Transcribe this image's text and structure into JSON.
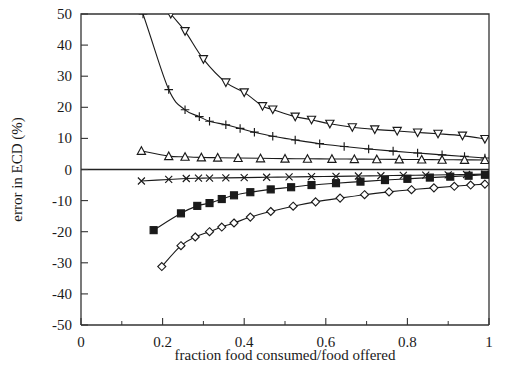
{
  "figure": {
    "background_color": "#ffffff",
    "foreground_color": "#1a1a1a"
  },
  "chart_data": {
    "type": "line",
    "title": "",
    "xlabel": "fraction food consumed/food offered",
    "ylabel": "error in ECD (%)",
    "xlim": [
      0,
      1
    ],
    "ylim": [
      -50,
      50
    ],
    "xticks": [
      0,
      0.2,
      0.4,
      0.6,
      0.8,
      1
    ],
    "xtick_labels": [
      "0",
      "0.2",
      "0.4",
      "0.6",
      "0.8",
      "1"
    ],
    "xticks_minor": [
      0.1,
      0.3,
      0.5,
      0.7,
      0.9
    ],
    "yticks": [
      50,
      40,
      30,
      20,
      10,
      0,
      -10,
      -20,
      -30,
      -40,
      -50
    ],
    "ytick_labels": [
      "50",
      "40",
      "30",
      "20",
      "10",
      "0",
      "-10",
      "-20",
      "-30",
      "-40",
      "-50"
    ],
    "grid": false,
    "legend": "none",
    "zero_reference_line": 0,
    "series": [
      {
        "name": "series-triangle-down",
        "marker": "triangle-down",
        "marker_style": "open",
        "marker_size": 7,
        "x": [
          0.22,
          0.255,
          0.3,
          0.355,
          0.4,
          0.445,
          0.47,
          0.525,
          0.565,
          0.61,
          0.665,
          0.72,
          0.775,
          0.825,
          0.875,
          0.935,
          0.99
        ],
        "y": [
          50.0,
          44.5,
          35.5,
          28.0,
          24.8,
          20.4,
          19.3,
          17.0,
          16.0,
          14.7,
          13.6,
          12.9,
          12.4,
          11.9,
          11.5,
          10.9,
          9.8
        ]
      },
      {
        "name": "series-plus",
        "marker": "plus",
        "marker_style": "open",
        "marker_size": 7,
        "x": [
          0.152,
          0.215,
          0.255,
          0.29,
          0.315,
          0.355,
          0.39,
          0.425,
          0.47,
          0.525,
          0.585,
          0.645,
          0.705,
          0.765,
          0.825,
          0.885,
          0.94,
          0.99
        ],
        "y": [
          50.0,
          25.7,
          19.2,
          17.0,
          15.5,
          14.4,
          13.2,
          12.0,
          10.7,
          9.5,
          8.3,
          7.4,
          6.6,
          5.9,
          5.3,
          4.7,
          4.2,
          3.7
        ]
      },
      {
        "name": "series-triangle-up",
        "marker": "triangle-up",
        "marker_style": "open",
        "marker_size": 7,
        "x": [
          0.148,
          0.215,
          0.255,
          0.295,
          0.335,
          0.385,
          0.44,
          0.5,
          0.555,
          0.615,
          0.67,
          0.725,
          0.78,
          0.835,
          0.885,
          0.94,
          0.99
        ],
        "y": [
          6.0,
          4.3,
          4.1,
          3.9,
          3.8,
          3.7,
          3.6,
          3.5,
          3.45,
          3.4,
          3.35,
          3.3,
          3.25,
          3.2,
          3.15,
          3.1,
          3.05
        ]
      },
      {
        "name": "series-cross",
        "marker": "cross",
        "marker_style": "open",
        "marker_size": 7,
        "x": [
          0.148,
          0.215,
          0.258,
          0.288,
          0.315,
          0.355,
          0.4,
          0.455,
          0.51,
          0.565,
          0.625,
          0.68,
          0.735,
          0.79,
          0.845,
          0.9,
          0.945,
          0.99
        ],
        "y": [
          -3.7,
          -3.2,
          -2.9,
          -2.8,
          -2.75,
          -2.7,
          -2.6,
          -2.5,
          -2.4,
          -2.3,
          -2.2,
          -2.1,
          -2.0,
          -1.9,
          -1.8,
          -1.7,
          -1.6,
          -1.5
        ]
      },
      {
        "name": "series-square-filled",
        "marker": "square",
        "marker_style": "filled",
        "marker_size": 7,
        "x": [
          0.178,
          0.245,
          0.285,
          0.315,
          0.345,
          0.375,
          0.415,
          0.465,
          0.515,
          0.565,
          0.625,
          0.685,
          0.745,
          0.8,
          0.855,
          0.905,
          0.95,
          0.99
        ],
        "y": [
          -19.5,
          -14.1,
          -11.7,
          -10.8,
          -9.5,
          -8.3,
          -7.3,
          -6.4,
          -5.7,
          -5.0,
          -4.4,
          -3.9,
          -3.4,
          -3.0,
          -2.6,
          -2.3,
          -2.0,
          -1.7
        ]
      },
      {
        "name": "series-diamond",
        "marker": "diamond",
        "marker_style": "open",
        "marker_size": 7,
        "x": [
          0.198,
          0.245,
          0.28,
          0.315,
          0.345,
          0.375,
          0.415,
          0.465,
          0.52,
          0.575,
          0.635,
          0.695,
          0.755,
          0.81,
          0.865,
          0.915,
          0.955,
          0.99
        ],
        "y": [
          -31.2,
          -24.5,
          -21.7,
          -20.0,
          -18.5,
          -17.2,
          -15.3,
          -13.5,
          -11.8,
          -10.4,
          -9.2,
          -8.1,
          -7.2,
          -6.5,
          -5.9,
          -5.4,
          -5.0,
          -4.7
        ]
      }
    ]
  }
}
